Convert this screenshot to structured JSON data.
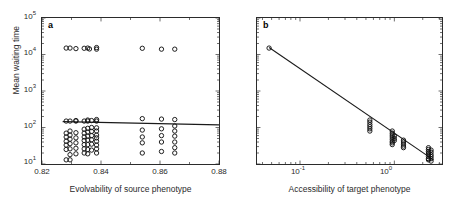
{
  "figure": {
    "panels": [
      {
        "letter": "a",
        "xlabel": "Evolvability of source phenotype",
        "ylabel": "Mean waiting time",
        "xticklabels": [
          "0.82",
          "0.84",
          "0.86",
          "0.88"
        ],
        "yticklabels": [
          "10",
          "10",
          "10",
          "10",
          "10"
        ],
        "yticksup": [
          "1",
          "2",
          "3",
          "4",
          "5"
        ]
      },
      {
        "letter": "b",
        "xlabel": "Accessibility of target phenotype",
        "ylabel": "",
        "xticklabels": [
          "10",
          "10"
        ],
        "xticksup": [
          "-1",
          "0"
        ],
        "yticklabels": []
      }
    ]
  },
  "chart_data": [
    {
      "type": "scatter",
      "panel": "a",
      "title": "",
      "xlabel": "Evolvability of source phenotype",
      "ylabel": "Mean waiting time",
      "xscale": "linear",
      "yscale": "log",
      "xlim": [
        0.82,
        0.88
      ],
      "ylim": [
        10,
        100000
      ],
      "xticks": [
        0.82,
        0.84,
        0.86,
        0.88
      ],
      "yticks": [
        10,
        100,
        1000,
        10000,
        100000
      ],
      "grid": false,
      "legend": null,
      "marker": "open-circle",
      "series": [
        {
          "name": "upper branch (slow waiting times)",
          "points": [
            [
              0.8282,
              15000
            ],
            [
              0.8295,
              15000
            ],
            [
              0.8315,
              14500
            ],
            [
              0.8343,
              14800
            ],
            [
              0.8355,
              15000
            ],
            [
              0.8361,
              14200
            ],
            [
              0.8385,
              15500
            ],
            [
              0.8385,
              14000
            ],
            [
              0.854,
              14800
            ],
            [
              0.8605,
              14000
            ],
            [
              0.865,
              14000
            ]
          ]
        },
        {
          "name": "lower branch (fast waiting times)",
          "points": [
            [
              0.8282,
              150
            ],
            [
              0.8282,
              70
            ],
            [
              0.8282,
              55
            ],
            [
              0.8282,
              42
            ],
            [
              0.8282,
              33
            ],
            [
              0.8282,
              25
            ],
            [
              0.8282,
              13
            ],
            [
              0.8295,
              150
            ],
            [
              0.8295,
              80
            ],
            [
              0.8295,
              62
            ],
            [
              0.8295,
              48
            ],
            [
              0.8295,
              36
            ],
            [
              0.8295,
              26
            ],
            [
              0.8295,
              18
            ],
            [
              0.8295,
              13
            ],
            [
              0.8315,
              155
            ],
            [
              0.8315,
              150
            ],
            [
              0.8315,
              72
            ],
            [
              0.8315,
              52
            ],
            [
              0.8315,
              38
            ],
            [
              0.8315,
              27
            ],
            [
              0.8315,
              19
            ],
            [
              0.8343,
              150
            ],
            [
              0.8343,
              90
            ],
            [
              0.8343,
              70
            ],
            [
              0.8343,
              55
            ],
            [
              0.8343,
              44
            ],
            [
              0.8343,
              34
            ],
            [
              0.8343,
              26
            ],
            [
              0.8343,
              20
            ],
            [
              0.8355,
              160
            ],
            [
              0.8355,
              150
            ],
            [
              0.8355,
              95
            ],
            [
              0.8355,
              75
            ],
            [
              0.8355,
              58
            ],
            [
              0.8355,
              45
            ],
            [
              0.8355,
              34
            ],
            [
              0.8355,
              25
            ],
            [
              0.8355,
              19
            ],
            [
              0.8368,
              155
            ],
            [
              0.8368,
              100
            ],
            [
              0.8368,
              78
            ],
            [
              0.8368,
              60
            ],
            [
              0.8368,
              46
            ],
            [
              0.8368,
              35
            ],
            [
              0.8368,
              24
            ],
            [
              0.8385,
              165
            ],
            [
              0.8385,
              150
            ],
            [
              0.8385,
              98
            ],
            [
              0.8385,
              80
            ],
            [
              0.8385,
              62
            ],
            [
              0.8385,
              52
            ],
            [
              0.8385,
              42
            ],
            [
              0.8385,
              33
            ],
            [
              0.8385,
              26
            ],
            [
              0.8385,
              20
            ],
            [
              0.854,
              175
            ],
            [
              0.854,
              85
            ],
            [
              0.854,
              55
            ],
            [
              0.854,
              38
            ],
            [
              0.854,
              20
            ],
            [
              0.8605,
              170
            ],
            [
              0.8605,
              92
            ],
            [
              0.8605,
              60
            ],
            [
              0.8605,
              40
            ],
            [
              0.8605,
              22
            ],
            [
              0.865,
              165
            ],
            [
              0.865,
              110
            ],
            [
              0.865,
              80
            ],
            [
              0.865,
              58
            ],
            [
              0.865,
              40
            ],
            [
              0.865,
              28
            ],
            [
              0.865,
              20
            ]
          ]
        }
      ],
      "trendline": {
        "name": "regression fit",
        "x": [
          0.827,
          0.88
        ],
        "y": [
          145,
          118
        ]
      }
    },
    {
      "type": "scatter",
      "panel": "b",
      "title": "",
      "xlabel": "Accessibility of target phenotype",
      "ylabel": "",
      "xscale": "log",
      "yscale": "log",
      "xlim": [
        0.035,
        3.2
      ],
      "ylim": [
        10,
        100000
      ],
      "xticks": [
        0.1,
        1.0
      ],
      "yticks": [],
      "grid": false,
      "legend": null,
      "marker": "open-circle",
      "series": [
        {
          "name": "waiting time vs accessibility",
          "points": [
            [
              0.047,
              15000
            ],
            [
              0.55,
              160
            ],
            [
              0.55,
              140
            ],
            [
              0.55,
              120
            ],
            [
              0.55,
              105
            ],
            [
              0.55,
              92
            ],
            [
              0.55,
              80
            ],
            [
              0.95,
              80
            ],
            [
              0.95,
              70
            ],
            [
              0.95,
              62
            ],
            [
              0.95,
              55
            ],
            [
              0.95,
              48
            ],
            [
              0.95,
              42
            ],
            [
              0.95,
              38
            ],
            [
              0.95,
              34
            ],
            [
              1.0,
              58
            ],
            [
              1.0,
              50
            ],
            [
              1.0,
              44
            ],
            [
              1.25,
              45
            ],
            [
              1.25,
              40
            ],
            [
              1.25,
              35
            ],
            [
              1.25,
              31
            ],
            [
              1.25,
              28
            ],
            [
              2.3,
              28
            ],
            [
              2.3,
              25
            ],
            [
              2.3,
              22
            ],
            [
              2.3,
              20
            ],
            [
              2.3,
              18
            ],
            [
              2.3,
              16
            ],
            [
              2.3,
              14
            ],
            [
              2.3,
              13
            ],
            [
              2.45,
              24
            ],
            [
              2.45,
              21
            ],
            [
              2.45,
              18
            ],
            [
              2.45,
              16
            ],
            [
              2.45,
              14
            ],
            [
              2.45,
              12
            ]
          ]
        }
      ],
      "trendline": {
        "name": "power-law fit",
        "x": [
          0.047,
          2.6
        ],
        "y": [
          15500,
          13
        ]
      }
    }
  ]
}
